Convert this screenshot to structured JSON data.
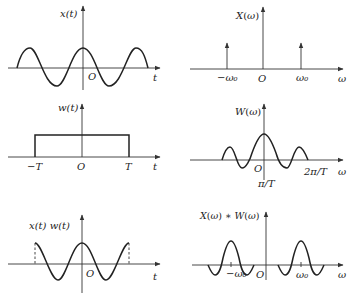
{
  "panels": [
    {
      "id": "time-signal",
      "ylabel": "x(t)",
      "xlabel": "t",
      "origin": "O",
      "description": "cosine signal x(t)"
    },
    {
      "id": "signal-spectrum",
      "ylabel": "X(ω)",
      "xlabel": "ω",
      "origin": "O",
      "ticks": [
        "−ω₀",
        "ω₀"
      ],
      "description": "impulses at −ω0, ω0 plus central arrow"
    },
    {
      "id": "window-time",
      "ylabel": "w(t)",
      "xlabel": "t",
      "origin": "O",
      "ticks": [
        "−T",
        "T"
      ],
      "description": "rectangular window from −T to T"
    },
    {
      "id": "window-spectrum",
      "ylabel": "W(ω)",
      "xlabel": "ω",
      "origin": "O",
      "ticks": [
        "π/T",
        "2π/T"
      ],
      "description": "sinc-shaped spectrum of window"
    },
    {
      "id": "windowed-signal",
      "ylabel": "x(t) w(t)",
      "xlabel": "t",
      "origin": "O",
      "description": "truncated cosine"
    },
    {
      "id": "convolved-spectrum",
      "ylabel": "X(ω) * W(ω)",
      "xlabel": "ω",
      "origin": "O",
      "ticks": [
        "−ω₀",
        "ω₀"
      ],
      "description": "sinc lobes centered at −ω0 and ω0"
    }
  ]
}
